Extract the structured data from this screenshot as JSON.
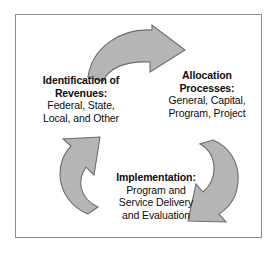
{
  "diagram": {
    "type": "cycle",
    "direction": "clockwise",
    "border_color": "#8c8c8c",
    "background_color": "#ffffff",
    "arrow_fill_color": "#b5b5b5",
    "arrow_stroke_color": "#6e6e6e",
    "text_color": "#0d0d0d",
    "stages": [
      {
        "id": "identification-of-revenues",
        "position": "left",
        "heading_line1": "Identification of",
        "heading_line2": "Revenues:",
        "body_line1": "Federal, State,",
        "body_line2": "Local, and Other"
      },
      {
        "id": "allocation-processes",
        "position": "right",
        "heading_line1": "Allocation",
        "heading_line2": "Processes:",
        "body_line1": "General, Capital,",
        "body_line2": "Program, Project"
      },
      {
        "id": "implementation",
        "position": "bottom",
        "heading_line1": "Implementation:",
        "body_line1": "Program and",
        "body_line2": "Service Delivery",
        "body_line3": "and Evaluation"
      }
    ],
    "arrows": [
      {
        "id": "arrow-top",
        "from": "identification-of-revenues",
        "to": "allocation-processes",
        "points": "right"
      },
      {
        "id": "arrow-right",
        "from": "allocation-processes",
        "to": "implementation",
        "points": "down-left"
      },
      {
        "id": "arrow-left",
        "from": "implementation",
        "to": "identification-of-revenues",
        "points": "up-left"
      }
    ]
  }
}
